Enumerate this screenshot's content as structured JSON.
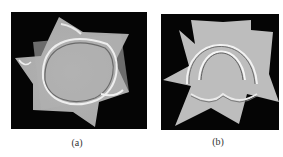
{
  "figure": {
    "panels": [
      {
        "id": "a",
        "caption": "(a)",
        "description": "star-shaped wave snapshot with curved triangular wavefront"
      },
      {
        "id": "b",
        "caption": "(b)",
        "description": "star-shaped wave snapshot with arch-shaped wavefronts"
      }
    ],
    "colors": {
      "background": "#050505",
      "surface": "#b8b8b8",
      "page": "#ffffff"
    }
  }
}
